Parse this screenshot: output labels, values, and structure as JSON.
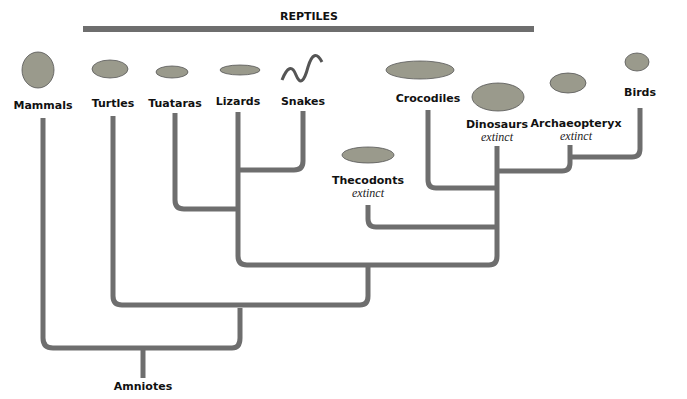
{
  "diagram": {
    "type": "cladogram",
    "group_label": "REPTILES",
    "root_label": "Amniotes",
    "line_color": "#6e6e6e",
    "taxa": [
      {
        "name": "Mammals",
        "status": ""
      },
      {
        "name": "Turtles",
        "status": ""
      },
      {
        "name": "Tuataras",
        "status": ""
      },
      {
        "name": "Lizards",
        "status": ""
      },
      {
        "name": "Snakes",
        "status": ""
      },
      {
        "name": "Thecodonts",
        "status": "extinct"
      },
      {
        "name": "Crocodiles",
        "status": ""
      },
      {
        "name": "Dinosaurs",
        "status": "extinct"
      },
      {
        "name": "Archaeopteryx",
        "status": "extinct"
      },
      {
        "name": "Birds",
        "status": ""
      }
    ]
  }
}
